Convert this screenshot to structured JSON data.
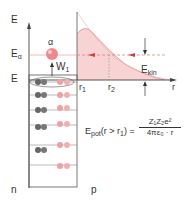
{
  "axis": {
    "energy_label": "E",
    "alpha_energy_label": "E",
    "alpha_energy_sub": "α",
    "well_top_label": "E",
    "r_axis_label": "r"
  },
  "particle": {
    "label": "α",
    "work_label": "W",
    "work_sub": "1"
  },
  "radii": {
    "r1_label": "r",
    "r1_sub": "1",
    "r2_label": "r",
    "r2_sub": "2"
  },
  "kinetic": {
    "label": "E",
    "sub": "kin"
  },
  "formula": {
    "lhs_main": "E",
    "lhs_sub": "pot",
    "lhs_cond": "(r > r",
    "lhs_cond_sub": "1",
    "lhs_close": ") =",
    "numerator": "Z₁Z₂e²",
    "denominator": "4πε₀ · r"
  },
  "regions": {
    "left_label": "n",
    "right_label": "p"
  },
  "colors": {
    "axis": "#444444",
    "barrier_fill": "#f6c9c9",
    "barrier_stroke": "#d98080",
    "dashed": "#e07070",
    "neutron": "#777777",
    "proton": "#f0a0a0",
    "alpha": "#f08a8a"
  }
}
